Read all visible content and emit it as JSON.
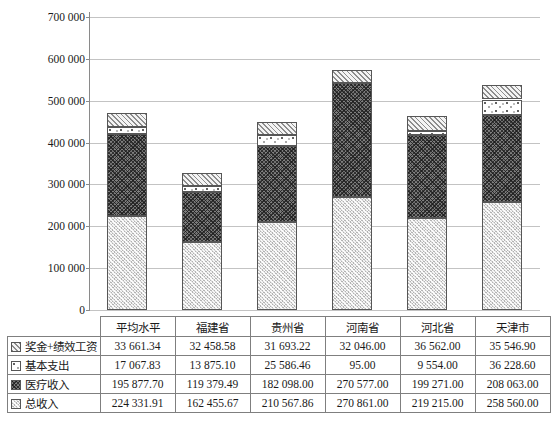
{
  "chart_data": {
    "type": "bar",
    "stacked": true,
    "title": "",
    "xlabel": "",
    "ylabel": "",
    "categories": [
      "平均水平",
      "福建省",
      "贵州省",
      "河南省",
      "河北省",
      "天津市"
    ],
    "series": [
      {
        "name": "奖金+绩效工资",
        "pattern_key": "diagonal-hatch",
        "values": [
          33661.34,
          32458.58,
          31693.22,
          32046.0,
          36562.0,
          35546.9
        ]
      },
      {
        "name": "基本支出",
        "pattern_key": "white-dots",
        "values": [
          17067.83,
          13875.1,
          25586.46,
          95.0,
          9554.0,
          36228.6
        ]
      },
      {
        "name": "医疗收入",
        "pattern_key": "dark-weave",
        "values": [
          195877.7,
          119379.49,
          182098.0,
          270577.0,
          199271.0,
          208063.0
        ]
      },
      {
        "name": "总收入",
        "pattern_key": "light-stipple",
        "values": [
          224331.91,
          162455.67,
          210567.86,
          270861.0,
          219215.0,
          258560.0
        ]
      }
    ],
    "stack_order_bottom_to_top": [
      "总收入",
      "医疗收入",
      "基本支出",
      "奖金+绩效工资"
    ],
    "ylim": [
      0,
      700000
    ],
    "ytick_interval": 100000,
    "ytick_labels": [
      "0",
      "100 000",
      "200 000",
      "300 000",
      "400 000",
      "500 000",
      "600 000",
      "700 000"
    ],
    "grid": true,
    "legend_position": "table-rows-left"
  },
  "table": {
    "column_headers": [
      "平均水平",
      "福建省",
      "贵州省",
      "河南省",
      "河北省",
      "天津市"
    ],
    "rows": [
      {
        "label": "奖金+绩效工资",
        "pattern_key": "diagonal-hatch",
        "values": [
          "33 661.34",
          "32 458.58",
          "31 693.22",
          "32 046.00",
          "36 562.00",
          "35 546.90"
        ]
      },
      {
        "label": "基本支出",
        "pattern_key": "white-dots",
        "values": [
          "17 067.83",
          "13 875.10",
          "25 586.46",
          "95.00",
          "9 554.00",
          "36 228.60"
        ]
      },
      {
        "label": "医疗收入",
        "pattern_key": "dark-weave",
        "values": [
          "195 877.70",
          "119 379.49",
          "182 098.00",
          "270 577.00",
          "199 271.00",
          "208 063.00"
        ]
      },
      {
        "label": "总收入",
        "pattern_key": "light-stipple",
        "values": [
          "224 331.91",
          "162 455.67",
          "210 567.86",
          "270 861.00",
          "219 215.00",
          "258 560.00"
        ]
      }
    ]
  },
  "colors": {
    "gridline": "#c3c3c3",
    "axis": "#8a8a8a",
    "table_border": "#7f7f7f",
    "text": "#1a1a1a",
    "background": "#ffffff"
  }
}
